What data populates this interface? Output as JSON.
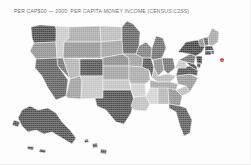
{
  "title": "PER CAP$00 — 2000: PER CAPITA MONEY INCOME (CENSUS:C2SS)",
  "map": {
    "name": "united-states-choropleth",
    "background_color": "#fdfdfd",
    "border_color": "#f4f4f4",
    "marker": {
      "name": "northeast-red-marker",
      "color": "#c0392b",
      "x": 222,
      "y": 60
    },
    "shades": {
      "darkest": "#3a3a3a",
      "dark": "#585858",
      "medium_dark": "#777777",
      "medium": "#949494",
      "light": "#b4b4b4",
      "lightest": "#d4d4d4"
    },
    "states": [
      {
        "code": "WA",
        "name": "Washington",
        "shade": "#454545"
      },
      {
        "code": "OR",
        "name": "Oregon",
        "shade": "#8d8d8d"
      },
      {
        "code": "CA",
        "name": "California",
        "shade": "#5a5a5a"
      },
      {
        "code": "ID",
        "name": "Idaho",
        "shade": "#c8c8c8"
      },
      {
        "code": "NV",
        "name": "Nevada",
        "shade": "#6e6e6e"
      },
      {
        "code": "UT",
        "name": "Utah",
        "shade": "#b0b0b0"
      },
      {
        "code": "AZ",
        "name": "Arizona",
        "shade": "#9b9b9b"
      },
      {
        "code": "MT",
        "name": "Montana",
        "shade": "#a8a8a8"
      },
      {
        "code": "WY",
        "name": "Wyoming",
        "shade": "#909090"
      },
      {
        "code": "CO",
        "name": "Colorado",
        "shade": "#4d4d4d"
      },
      {
        "code": "NM",
        "name": "New Mexico",
        "shade": "#c4c4c4"
      },
      {
        "code": "ND",
        "name": "North Dakota",
        "shade": "#b8b8b8"
      },
      {
        "code": "SD",
        "name": "South Dakota",
        "shade": "#a0a0a0"
      },
      {
        "code": "NE",
        "name": "Nebraska",
        "shade": "#888888"
      },
      {
        "code": "KS",
        "name": "Kansas",
        "shade": "#9d9d9d"
      },
      {
        "code": "OK",
        "name": "Oklahoma",
        "shade": "#c0c0c0"
      },
      {
        "code": "TX",
        "name": "Texas",
        "shade": "#4a4a4a"
      },
      {
        "code": "MN",
        "name": "Minnesota",
        "shade": "#5e5e5e"
      },
      {
        "code": "IA",
        "name": "Iowa",
        "shade": "#9a9a9a"
      },
      {
        "code": "MO",
        "name": "Missouri",
        "shade": "#a6a6a6"
      },
      {
        "code": "AR",
        "name": "Arkansas",
        "shade": "#cccccc"
      },
      {
        "code": "LA",
        "name": "Louisiana",
        "shade": "#bdbdbd"
      },
      {
        "code": "WI",
        "name": "Wisconsin",
        "shade": "#7a7a7a"
      },
      {
        "code": "IL",
        "name": "Illinois",
        "shade": "#4f4f4f"
      },
      {
        "code": "MI",
        "name": "Michigan",
        "shade": "#6a6a6a"
      },
      {
        "code": "IN",
        "name": "Indiana",
        "shade": "#8a8a8a"
      },
      {
        "code": "OH",
        "name": "Ohio",
        "shade": "#6d6d6d"
      },
      {
        "code": "KY",
        "name": "Kentucky",
        "shade": "#b6b6b6"
      },
      {
        "code": "TN",
        "name": "Tennessee",
        "shade": "#a2a2a2"
      },
      {
        "code": "MS",
        "name": "Mississippi",
        "shade": "#d0d0d0"
      },
      {
        "code": "AL",
        "name": "Alabama",
        "shade": "#b2b2b2"
      },
      {
        "code": "GA",
        "name": "Georgia",
        "shade": "#8e8e8e"
      },
      {
        "code": "FL",
        "name": "Florida",
        "shade": "#565656"
      },
      {
        "code": "SC",
        "name": "South Carolina",
        "shade": "#b9b9b9"
      },
      {
        "code": "NC",
        "name": "North Carolina",
        "shade": "#959595"
      },
      {
        "code": "VA",
        "name": "Virginia",
        "shade": "#4c4c4c"
      },
      {
        "code": "WV",
        "name": "West Virginia",
        "shade": "#c6c6c6"
      },
      {
        "code": "PA",
        "name": "Pennsylvania",
        "shade": "#6f6f6f"
      },
      {
        "code": "NY",
        "name": "New York",
        "shade": "#3e3e3e"
      },
      {
        "code": "VT",
        "name": "Vermont",
        "shade": "#8b8b8b"
      },
      {
        "code": "NH",
        "name": "New Hampshire",
        "shade": "#5d5d5d"
      },
      {
        "code": "ME",
        "name": "Maine",
        "shade": "#a4a4a4"
      },
      {
        "code": "MA",
        "name": "Massachusetts",
        "shade": "#3c3c3c"
      },
      {
        "code": "RI",
        "name": "Rhode Island",
        "shade": "#4e4e4e"
      },
      {
        "code": "CT",
        "name": "Connecticut",
        "shade": "#404040"
      },
      {
        "code": "NJ",
        "name": "New Jersey",
        "shade": "#3d3d3d"
      },
      {
        "code": "DE",
        "name": "Delaware",
        "shade": "#464646"
      },
      {
        "code": "MD",
        "name": "Maryland",
        "shade": "#414141"
      },
      {
        "code": "AK",
        "name": "Alaska",
        "shade": "#4b4b4b"
      },
      {
        "code": "HI",
        "name": "Hawaii",
        "shade": "#565656"
      }
    ]
  }
}
